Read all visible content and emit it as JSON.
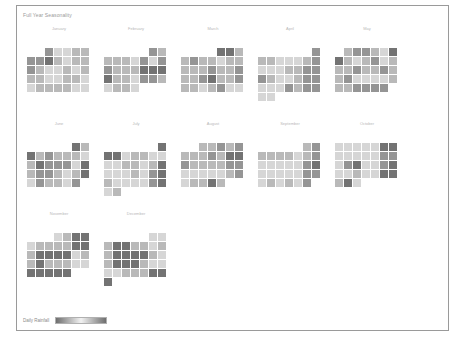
{
  "chart_data": {
    "type": "heatmap",
    "title": "Full Year Seasonality",
    "legend": {
      "label": "Daily Rainfall",
      "low_color": "#f2f2f2",
      "high_color": "#6e6e6e",
      "position": "bottom-left"
    },
    "scale": [
      "#ffffff",
      "#ececec",
      "#d6d6d6",
      "#b9b9b9",
      "#959595",
      "#737373"
    ],
    "months": [
      {
        "name": "January",
        "offset": 2,
        "values": [
          3,
          1,
          1,
          2,
          2,
          3,
          3,
          4,
          2,
          1,
          2,
          2,
          3,
          2,
          1,
          1,
          2,
          1,
          2,
          2,
          2,
          1,
          1,
          2,
          2,
          1,
          1,
          2,
          2,
          2,
          2,
          1,
          1
        ]
      },
      {
        "name": "February",
        "offset": 5,
        "values": [
          3,
          2,
          2,
          2,
          2,
          1,
          3,
          1,
          3,
          3,
          2,
          2,
          2,
          4,
          4,
          4,
          4,
          2,
          2,
          1,
          3,
          3,
          2,
          1,
          2,
          2,
          1
        ]
      },
      {
        "name": "March",
        "offset": 4,
        "values": [
          4,
          4,
          2,
          2,
          3,
          2,
          2,
          1,
          2,
          2,
          2,
          2,
          2,
          3,
          2,
          2,
          3,
          2,
          2,
          3,
          4,
          2,
          2,
          3,
          2,
          2,
          1,
          2,
          3,
          1,
          1
        ]
      },
      {
        "name": "April",
        "offset": 6,
        "values": [
          3,
          2,
          2,
          1,
          1,
          1,
          2,
          3,
          1,
          1,
          1,
          2,
          2,
          3,
          3,
          3,
          2,
          1,
          1,
          2,
          3,
          3,
          1,
          1,
          1,
          3,
          2,
          3,
          3,
          1,
          1
        ]
      },
      {
        "name": "May",
        "offset": 1,
        "values": [
          2,
          3,
          3,
          2,
          1,
          4,
          4,
          2,
          1,
          2,
          3,
          1,
          2,
          2,
          2,
          3,
          2,
          2,
          3,
          2,
          2,
          3,
          1,
          1,
          1,
          1,
          2,
          2,
          2,
          3,
          3,
          3,
          3
        ]
      },
      {
        "name": "June",
        "offset": 5,
        "values": [
          4,
          2,
          4,
          2,
          3,
          2,
          2,
          2,
          1,
          2,
          4,
          3,
          3,
          3,
          1,
          4,
          2,
          3,
          3,
          2,
          1,
          2,
          4,
          1,
          3,
          2,
          2,
          1,
          3
        ]
      },
      {
        "name": "July",
        "offset": 6,
        "values": [
          4,
          4,
          4,
          1,
          2,
          2,
          1,
          1,
          1,
          1,
          2,
          2,
          1,
          2,
          4,
          1,
          1,
          1,
          2,
          1,
          3,
          4,
          2,
          1,
          1,
          1,
          1,
          3,
          4,
          1,
          2
        ]
      },
      {
        "name": "August",
        "offset": 2,
        "values": [
          2,
          2,
          3,
          2,
          3,
          2,
          2,
          2,
          3,
          2,
          4,
          4,
          3,
          2,
          2,
          2,
          2,
          3,
          3,
          1,
          1,
          1,
          1,
          1,
          2,
          3,
          1,
          2,
          2,
          4,
          2
        ]
      },
      {
        "name": "September",
        "offset": 5,
        "values": [
          2,
          3,
          2,
          2,
          2,
          2,
          1,
          2,
          3,
          1,
          1,
          1,
          1,
          1,
          3,
          4,
          1,
          1,
          1,
          1,
          1,
          3,
          3,
          1,
          2,
          1,
          2,
          1,
          3
        ]
      },
      {
        "name": "October",
        "offset": 0,
        "values": [
          1,
          1,
          1,
          1,
          1,
          4,
          4,
          1,
          1,
          1,
          1,
          1,
          3,
          3,
          1,
          3,
          4,
          1,
          1,
          3,
          4,
          1,
          1,
          2,
          1,
          1,
          4,
          4,
          2,
          4,
          1
        ]
      },
      {
        "name": "November",
        "offset": 3,
        "values": [
          1,
          2,
          4,
          4,
          1,
          2,
          2,
          2,
          2,
          4,
          4,
          2,
          4,
          4,
          4,
          4,
          1,
          2,
          2,
          4,
          2,
          2,
          2,
          1,
          1,
          4,
          4,
          4,
          4,
          4
        ]
      },
      {
        "name": "December",
        "offset": 5,
        "values": [
          1,
          1,
          2,
          4,
          4,
          2,
          2,
          1,
          2,
          2,
          4,
          4,
          4,
          4,
          2,
          1,
          2,
          4,
          4,
          4,
          2,
          1,
          1,
          1,
          1,
          2,
          2,
          2,
          4,
          4,
          4
        ]
      }
    ]
  }
}
